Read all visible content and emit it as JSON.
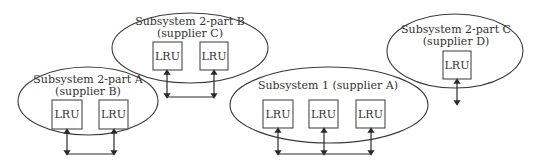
{
  "diagram": {
    "subsystems": [
      {
        "id": "sub2b",
        "title_line1": "Subsystem 2-part B",
        "title_line2": "(supplier C)",
        "lrus": [
          "LRU",
          "LRU"
        ]
      },
      {
        "id": "sub2a",
        "title_line1": "Subsystem 2-part A",
        "title_line2": "(supplier B)",
        "lrus": [
          "LRU",
          "LRU"
        ]
      },
      {
        "id": "sub1",
        "title_line1": "Subsystem 1 (supplier A)",
        "lrus": [
          "LRU",
          "LRU",
          "LRU"
        ]
      },
      {
        "id": "sub2c",
        "title_line1": "Subsystem 2-part C",
        "title_line2": "(supplier D)",
        "lrus": [
          "LRU"
        ]
      }
    ],
    "colors": {
      "stroke": "#3a3a3a",
      "text": "#333333",
      "background": "#ffffff"
    }
  }
}
